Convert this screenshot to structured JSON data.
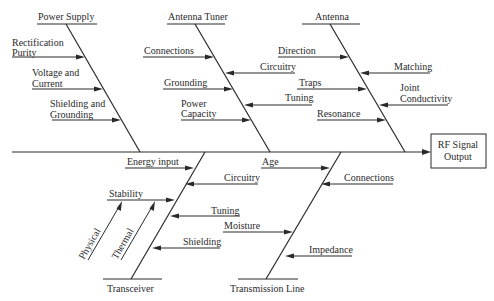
{
  "diagram": {
    "type": "fishbone",
    "effect": {
      "label_line1": "RF Signal",
      "label_line2": "Output"
    },
    "categories": {
      "power_supply": {
        "label": "Power Supply",
        "causes": [
          {
            "line1": "Rectification",
            "line2": "Purity"
          },
          {
            "line1": "Voltage and",
            "line2": "Current"
          },
          {
            "line1": "Shielding and",
            "line2": "Grounding"
          }
        ]
      },
      "antenna_tuner": {
        "label": "Antenna Tuner",
        "causes": [
          {
            "line1": "Connections"
          },
          {
            "line1": "Circuitry"
          },
          {
            "line1": "Grounding"
          },
          {
            "line1": "Tuning"
          },
          {
            "line1": "Power",
            "line2": "Capacity"
          }
        ]
      },
      "antenna": {
        "label": "Antenna",
        "causes": [
          {
            "line1": "Direction"
          },
          {
            "line1": "Matching"
          },
          {
            "line1": "Traps"
          },
          {
            "line1": "Joint",
            "line2": "Conductivity"
          },
          {
            "line1": "Resonance"
          }
        ]
      },
      "transceiver": {
        "label": "Transceiver",
        "causes": [
          {
            "line1": "Energy input"
          },
          {
            "line1": "Circuitry"
          },
          {
            "line1": "Stability"
          },
          {
            "line1": "Tuning"
          },
          {
            "line1": "Shielding"
          }
        ],
        "sub_causes": [
          "Physical",
          "Thermal"
        ]
      },
      "transmission_line": {
        "label": "Transmission Line",
        "causes": [
          {
            "line1": "Age"
          },
          {
            "line1": "Connections"
          },
          {
            "line1": "Moisture"
          },
          {
            "line1": "Impedance"
          }
        ]
      }
    }
  }
}
